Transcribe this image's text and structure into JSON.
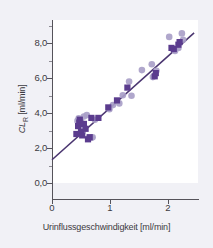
{
  "chart_data": {
    "type": "scatter",
    "title": "",
    "xlabel": "Urinflussgeschwindigkeit [ml/min]",
    "ylabel": "CL_R [ml/min]",
    "ylabel_main": "CL",
    "ylabel_sub": "R",
    "ylabel_unit": " [ml/min]",
    "xlim": [
      0,
      2.5
    ],
    "ylim": [
      0,
      9.2
    ],
    "xticks": [
      "0",
      "1",
      "2"
    ],
    "xtick_values": [
      0,
      1,
      2
    ],
    "yticks": [
      "0,0",
      "2,0",
      "4,0",
      "6,0",
      "8,0"
    ],
    "ytick_values": [
      0,
      2,
      4,
      6,
      8
    ],
    "yticks_minor": [
      1,
      3,
      5,
      7,
      9
    ],
    "grid": false,
    "legend": "none",
    "colors": {
      "marker_square": "#5b3c8e",
      "marker_circle": "#a99fc8",
      "regression_line": "#4a3570",
      "axis": "#55535a",
      "panel_background": "#ffffff",
      "figure_background": "#f1f1f6",
      "text": "#3c3a41"
    },
    "regression": {
      "intercept": 1.33,
      "slope": 2.96,
      "x_start": 0.0,
      "x_end": 2.45
    },
    "series": [
      {
        "name": "Mittelwert",
        "marker": "square",
        "color": "#5b3c8e",
        "points": [
          [
            0.42,
            2.8
          ],
          [
            0.45,
            3.25
          ],
          [
            0.47,
            3.45
          ],
          [
            0.48,
            3.62
          ],
          [
            0.5,
            2.92
          ],
          [
            0.52,
            2.72
          ],
          [
            0.55,
            3.38
          ],
          [
            0.58,
            3.1
          ],
          [
            0.62,
            2.5
          ],
          [
            0.65,
            2.62
          ],
          [
            0.68,
            3.72
          ],
          [
            0.8,
            3.72
          ],
          [
            0.97,
            4.32
          ],
          [
            1.12,
            4.72
          ],
          [
            1.3,
            5.45
          ],
          [
            1.77,
            6.1
          ],
          [
            1.79,
            6.28
          ],
          [
            2.06,
            7.72
          ],
          [
            2.1,
            7.65
          ],
          [
            2.18,
            7.9
          ],
          [
            2.2,
            8.05
          ]
        ]
      },
      {
        "name": "Einzelwerte",
        "marker": "circle",
        "color": "#a99fc8",
        "points": [
          [
            0.44,
            3.55
          ],
          [
            0.46,
            3.7
          ],
          [
            0.49,
            3.35
          ],
          [
            0.5,
            3.52
          ],
          [
            0.52,
            3.22
          ],
          [
            0.53,
            2.95
          ],
          [
            0.55,
            3.8
          ],
          [
            0.6,
            3.88
          ],
          [
            0.63,
            2.55
          ],
          [
            0.68,
            2.58
          ],
          [
            0.7,
            2.62
          ],
          [
            0.74,
            3.62
          ],
          [
            0.99,
            4.22
          ],
          [
            1.05,
            4.45
          ],
          [
            1.16,
            4.55
          ],
          [
            1.22,
            5.02
          ],
          [
            1.33,
            5.8
          ],
          [
            1.37,
            4.98
          ],
          [
            1.55,
            6.45
          ],
          [
            1.72,
            6.78
          ],
          [
            1.74,
            6.05
          ],
          [
            1.8,
            6.42
          ],
          [
            2.02,
            8.35
          ],
          [
            2.12,
            7.55
          ],
          [
            2.18,
            7.72
          ],
          [
            2.24,
            8.55
          ],
          [
            2.26,
            8.18
          ]
        ]
      }
    ]
  }
}
